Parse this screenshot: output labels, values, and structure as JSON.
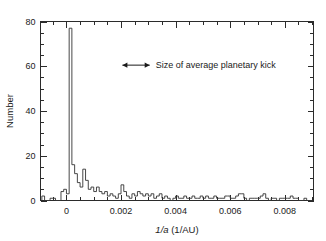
{
  "chart_data": {
    "type": "bar",
    "title": "",
    "subtitle": "",
    "xlabel": "1/a (1/AU)",
    "xlabel_parts": {
      "italic": "1/a",
      "rest": " (1/AU)"
    },
    "ylabel": "Number",
    "xlim": [
      -0.00095,
      0.00905
    ],
    "ylim": [
      0,
      80
    ],
    "grid": false,
    "legend": null,
    "bin_width": 0.0001,
    "x_ticks": [
      0,
      0.002,
      0.004,
      0.006,
      0.008
    ],
    "x_tick_labels": [
      "0",
      "0.002",
      "0.004",
      "0.006",
      "0.008"
    ],
    "x_minor_tick_step": 0.0005,
    "y_ticks": [
      0,
      20,
      40,
      60,
      80
    ],
    "y_tick_labels": [
      "0",
      "20",
      "40",
      "60",
      "80"
    ],
    "y_minor_tick_step": 5,
    "bin_left_edges": [
      -0.0009,
      -0.0008,
      -0.0007,
      -0.0006,
      -0.0005,
      -0.0004,
      -0.0003,
      -0.0002,
      -0.0001,
      0.0,
      0.0001,
      0.0002,
      0.0003,
      0.0004,
      0.0005,
      0.0006,
      0.0007,
      0.0008,
      0.0009,
      0.001,
      0.0011,
      0.0012,
      0.0013,
      0.0014,
      0.0015,
      0.0016,
      0.0017,
      0.0018,
      0.0019,
      0.002,
      0.0021,
      0.0022,
      0.0023,
      0.0024,
      0.0025,
      0.0026,
      0.0027,
      0.0028,
      0.0029,
      0.003,
      0.0031,
      0.0032,
      0.0033,
      0.0034,
      0.0035,
      0.0036,
      0.0037,
      0.0038,
      0.0039,
      0.004,
      0.0041,
      0.0042,
      0.0043,
      0.0044,
      0.0045,
      0.0046,
      0.0047,
      0.0048,
      0.0049,
      0.005,
      0.0051,
      0.0052,
      0.0053,
      0.0054,
      0.0055,
      0.0056,
      0.0057,
      0.0058,
      0.0059,
      0.006,
      0.0061,
      0.0062,
      0.0063,
      0.0064,
      0.0065,
      0.0066,
      0.0067,
      0.0068,
      0.0069,
      0.007,
      0.0071,
      0.0072,
      0.0073,
      0.0074,
      0.0075,
      0.0076,
      0.0077,
      0.0078,
      0.0079,
      0.008,
      0.0081,
      0.0082,
      0.0083,
      0.0084,
      0.0085,
      0.0086,
      0.0087,
      0.0088,
      0.0089
    ],
    "values": [
      2,
      0,
      0,
      1,
      1,
      0,
      0,
      4,
      5,
      3,
      77,
      16,
      12,
      8,
      6,
      14,
      9,
      5,
      6,
      4,
      6,
      4,
      3,
      4,
      2,
      3,
      2,
      1,
      3,
      7,
      4,
      2,
      1,
      3,
      2,
      4,
      3,
      2,
      3,
      2,
      3,
      1,
      2,
      3,
      1,
      2,
      1,
      0,
      1,
      2,
      1,
      1,
      2,
      1,
      1,
      2,
      1,
      1,
      2,
      1,
      2,
      1,
      1,
      2,
      1,
      1,
      1,
      2,
      2,
      1,
      1,
      2,
      3,
      3,
      1,
      0,
      1,
      1,
      1,
      1,
      2,
      3,
      1,
      0,
      1,
      1,
      0,
      1,
      1,
      1,
      1,
      2,
      1,
      1,
      0,
      0,
      1,
      0,
      0
    ],
    "annotations": [
      {
        "name": "planetary-kick-annotation",
        "text": "Size of average planetary kick",
        "arrow_type": "double-headed",
        "arrow_x_start": 0.00205,
        "arrow_x_end": 0.00305,
        "y": 60.5
      }
    ]
  },
  "axes": {
    "ylabel": "Number",
    "xlabel_italic": "1/a",
    "xlabel_rest": " (1/AU)"
  },
  "style": {
    "line_color": "#333333",
    "axis_color": "#2b2b2b",
    "text_color": "#1a1a1a",
    "background": "#ffffff"
  }
}
